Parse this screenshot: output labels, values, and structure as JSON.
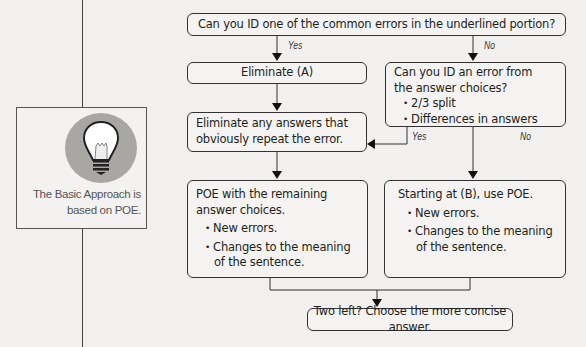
{
  "sidebar": {
    "icon": "lightbulb-icon",
    "caption_line1": "The Basic Approach is",
    "caption_line2": "based on POE."
  },
  "flowchart": {
    "start": {
      "text": "Can you ID one of the common errors in the underlined portion?"
    },
    "branch_yes_label": "Yes",
    "branch_no_label": "No",
    "eliminate_a": {
      "text": "Eliminate (A)"
    },
    "question_choices": {
      "line1": "Can you ID an error from",
      "line2": "the answer choices?",
      "bullets": [
        "2/3 split",
        "Differences in answers"
      ]
    },
    "eliminate_repeats": {
      "line1": "Eliminate any answers that",
      "line2": "obviously repeat the error."
    },
    "choices_yes_label": "Yes",
    "choices_no_label": "No",
    "poe_remaining": {
      "line1": "POE with the remaining",
      "line2": "answer choices.",
      "bullets": [
        "New errors.",
        "Changes to the meaning"
      ],
      "bullet2_cont": "of the sentence."
    },
    "start_b": {
      "line1": "Starting at (B), use POE.",
      "bullets": [
        "New errors.",
        "Changes to the meaning"
      ],
      "bullet2_cont": "of the sentence."
    },
    "final": {
      "text": "Two left? Choose the more concise answer."
    }
  },
  "colors": {
    "background": "#f1f0ee",
    "line": "#333333",
    "icon_circle": "#a9a7a4"
  }
}
